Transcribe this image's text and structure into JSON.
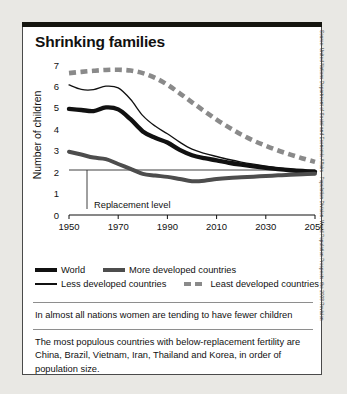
{
  "chart_data": {
    "type": "line",
    "title": "Shrinking families",
    "xlabel": "",
    "ylabel": "Number of children",
    "xlim": [
      1950,
      2050
    ],
    "ylim": [
      0,
      7
    ],
    "xticks": [
      "1950",
      "1970",
      "1990",
      "2010",
      "2030",
      "2050"
    ],
    "yticks": [
      "0",
      "1",
      "2",
      "3",
      "4",
      "5",
      "6",
      "7"
    ],
    "grid": false,
    "legend_position": "below-plot",
    "annotations": [
      {
        "label": "Replacement level",
        "value": 2.1,
        "type": "horizontal-reference-line"
      }
    ],
    "x": [
      1950,
      1955,
      1960,
      1965,
      1970,
      1975,
      1980,
      1985,
      1990,
      1995,
      2000,
      2005,
      2010,
      2015,
      2020,
      2025,
      2030,
      2035,
      2040,
      2045,
      2050
    ],
    "series": [
      {
        "name": "World",
        "style": "thick-black",
        "color": "#111111",
        "values": [
          4.95,
          4.9,
          4.85,
          5.02,
          4.93,
          4.47,
          3.9,
          3.6,
          3.38,
          3.04,
          2.79,
          2.65,
          2.55,
          2.44,
          2.35,
          2.27,
          2.2,
          2.14,
          2.09,
          2.05,
          2.02
        ]
      },
      {
        "name": "More developed countries",
        "style": "thick-gray",
        "color": "#4d4d4d",
        "values": [
          2.95,
          2.82,
          2.68,
          2.61,
          2.38,
          2.15,
          1.92,
          1.84,
          1.78,
          1.68,
          1.58,
          1.6,
          1.68,
          1.73,
          1.76,
          1.79,
          1.82,
          1.85,
          1.88,
          1.9,
          1.93
        ]
      },
      {
        "name": "Less developed countries",
        "style": "thin-black",
        "color": "#111111",
        "values": [
          6.07,
          5.86,
          5.85,
          6.01,
          5.93,
          5.4,
          4.64,
          4.15,
          3.79,
          3.4,
          3.07,
          2.88,
          2.73,
          2.59,
          2.47,
          2.37,
          2.28,
          2.2,
          2.14,
          2.09,
          2.05
        ]
      },
      {
        "name": "Least developed countries",
        "style": "dashed-gray",
        "color": "#8a8a8a",
        "values": [
          6.62,
          6.68,
          6.73,
          6.77,
          6.78,
          6.74,
          6.62,
          6.4,
          6.08,
          5.68,
          5.26,
          4.85,
          4.45,
          4.09,
          3.76,
          3.47,
          3.23,
          3.01,
          2.82,
          2.64,
          2.48
        ]
      }
    ]
  },
  "notes": {
    "note1": "In almost all nations women are tending to have fewer children",
    "note2": "The most populous countries with below-replacement fertility are China, Brazil, Vietnam, Iran, Thailand and Korea, in order of population size."
  },
  "source": {
    "text": "Source: United Nations Department of Social and Economic Affairs - Population Division, World Population Prospects: the 2008 Revision"
  }
}
